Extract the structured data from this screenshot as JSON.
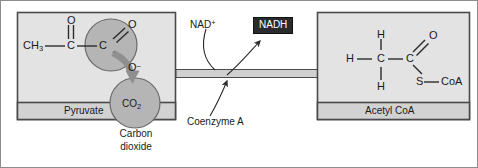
{
  "figure": {
    "background_color": "#ffffff",
    "border_color": "#8d8d8d"
  },
  "colors": {
    "panel_fill": "#e3e3e3",
    "panel_caption_fill": "#d2d2d2",
    "panel_stroke": "#4a4a4a",
    "circle_fill": "#b5b5b5",
    "circle_stroke": "#6a6a6a",
    "block_arrow_fill": "#d0d0d0",
    "block_arrow_stroke": "#4a4a4a",
    "curved_arrow_fill": "#8f8f8f",
    "thin_arrow_stroke": "#2b2b2b",
    "nadh_chip_fill": "#2b2b2b",
    "nadh_chip_text": "#ffffff",
    "text": "#1a1a1a"
  },
  "left_panel": {
    "caption": "Pyruvate",
    "molecule": {
      "name": "pyruvate",
      "atoms": [
        {
          "id": "methyl",
          "text": "CH",
          "subscript": "3"
        },
        {
          "id": "carbonyl-oxygen",
          "text": "O"
        },
        {
          "id": "carbonyl-carbon",
          "text": "C"
        },
        {
          "id": "carboxyl-carbon",
          "text": "C"
        },
        {
          "id": "carboxyl-oxygen-double",
          "text": "O"
        },
        {
          "id": "carboxyl-oxygen-anion",
          "text": "O",
          "superscript": "–"
        }
      ]
    },
    "highlight_circle_label": "",
    "co2_circle_label": "CO",
    "co2_circle_sub": "2"
  },
  "co2_caption": {
    "line1": "Carbon",
    "line2": "dioxide"
  },
  "center": {
    "nad_plus": {
      "text": "NAD",
      "superscript": "+"
    },
    "nadh": "NADH",
    "coenzyme_a": "Coenzyme A",
    "reaction_arrow": "reaction-block-arrow"
  },
  "right_panel": {
    "caption": "Acetyl CoA",
    "molecule": {
      "name": "acetyl CoA",
      "atoms": [
        {
          "id": "h-top",
          "text": "H"
        },
        {
          "id": "h-left",
          "text": "H"
        },
        {
          "id": "h-bottom",
          "text": "H"
        },
        {
          "id": "methyl-carbon",
          "text": "C"
        },
        {
          "id": "carbonyl-carbon",
          "text": "C"
        },
        {
          "id": "carbonyl-oxygen",
          "text": "O"
        },
        {
          "id": "sulfur",
          "text": "S"
        },
        {
          "id": "coa",
          "text": "CoA"
        }
      ]
    }
  }
}
